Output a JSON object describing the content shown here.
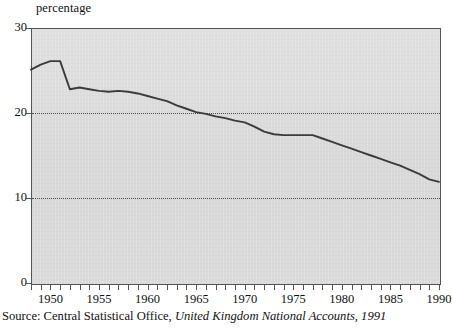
{
  "chart_data": {
    "type": "line",
    "title": "",
    "subtitle": "",
    "ylabel": "percentage",
    "xlabel": "",
    "ylim": [
      0,
      30
    ],
    "yticks": [
      0,
      10,
      20,
      30
    ],
    "ytick_labels": [
      "0",
      "10",
      "20",
      "30"
    ],
    "gridlines_y": [
      10,
      20
    ],
    "grid": "dotted horizontal gridlines at 10 and 20",
    "legend": "none",
    "xlim": [
      1948,
      1990
    ],
    "xticks": [
      1948,
      1949,
      1950,
      1951,
      1952,
      1953,
      1954,
      1955,
      1956,
      1957,
      1958,
      1959,
      1960,
      1961,
      1962,
      1963,
      1964,
      1965,
      1966,
      1967,
      1968,
      1969,
      1970,
      1971,
      1972,
      1973,
      1974,
      1975,
      1976,
      1977,
      1978,
      1979,
      1980,
      1981,
      1982,
      1983,
      1984,
      1985,
      1986,
      1987,
      1988,
      1989,
      1990
    ],
    "xtick_labels": [
      "1950",
      "1955",
      "1960",
      "1965",
      "1970",
      "1975",
      "1980",
      "1985",
      "1990"
    ],
    "xtick_label_years": [
      1950,
      1955,
      1960,
      1965,
      1970,
      1975,
      1980,
      1985,
      1990
    ],
    "series": [
      {
        "name": "percentage",
        "color": "#3b3b3b",
        "x": [
          1948,
          1949,
          1950,
          1951,
          1952,
          1953,
          1954,
          1955,
          1956,
          1957,
          1958,
          1959,
          1960,
          1961,
          1962,
          1963,
          1964,
          1965,
          1966,
          1967,
          1968,
          1969,
          1970,
          1971,
          1972,
          1973,
          1974,
          1975,
          1976,
          1977,
          1978,
          1979,
          1980,
          1981,
          1982,
          1983,
          1984,
          1985,
          1986,
          1987,
          1988,
          1989,
          1990
        ],
        "values": [
          25.1,
          25.7,
          26.1,
          26.1,
          22.8,
          23.0,
          22.8,
          22.6,
          22.5,
          22.6,
          22.5,
          22.3,
          22.0,
          21.7,
          21.4,
          20.9,
          20.5,
          20.1,
          19.9,
          19.6,
          19.4,
          19.1,
          18.9,
          18.4,
          17.8,
          17.5,
          17.4,
          17.4,
          17.4,
          17.4,
          17.0,
          16.6,
          16.2,
          15.8,
          15.4,
          15.0,
          14.6,
          14.2,
          13.8,
          13.3,
          12.8,
          12.2,
          11.9
        ]
      }
    ]
  },
  "axis": {
    "ylabel": "percentage"
  },
  "source": {
    "prefix": "Source: Central Statistical Office,",
    "publication": "United Kingdom National Accounts, 1991"
  }
}
